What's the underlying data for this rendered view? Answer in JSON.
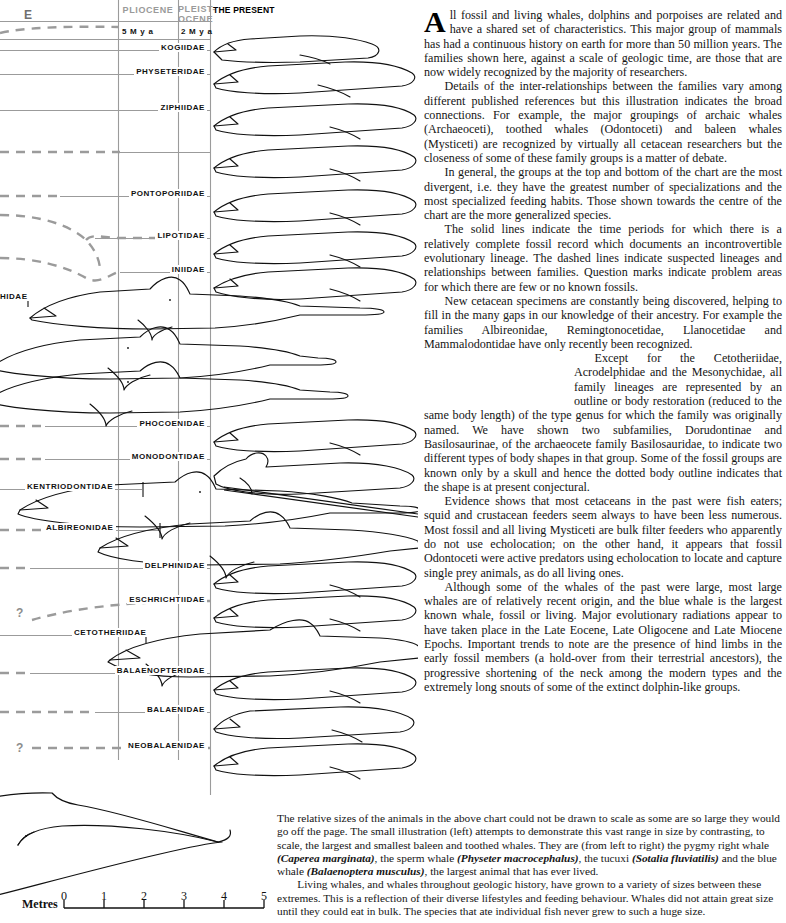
{
  "chart": {
    "left_epoch_partial": "E",
    "epochs": [
      {
        "label": "PLIOCENE",
        "x": 118,
        "w": 60
      },
      {
        "label": "PLEIST-\nOCENE",
        "x": 178,
        "w": 32
      },
      {
        "label": "THE PRESENT",
        "x": 211,
        "w": 70
      }
    ],
    "mya_marks": [
      {
        "label": "5 M y a",
        "x": 122,
        "y": 29
      },
      {
        "label": "2 M y a",
        "x": 181,
        "y": 29
      }
    ],
    "vertical_gridlines": [
      118,
      178,
      210
    ],
    "families": [
      {
        "name": "KOGIIDAE",
        "y": 50,
        "line": "solid",
        "line_from": 0,
        "line_to": 210,
        "label_right": 207
      },
      {
        "name": "PHYSETERIDAE",
        "y": 74,
        "line": "solid",
        "line_from": 0,
        "line_to": 210,
        "label_right": 207
      },
      {
        "name": "ZIPHIIDAE",
        "y": 110,
        "line": "solid",
        "line_from": 0,
        "line_to": 210,
        "label_right": 207
      },
      {
        "name": "",
        "y": 152,
        "line": "dashed",
        "line_from": 0,
        "line_to": 210,
        "label_right": 207
      },
      {
        "name": "PONTOPORIIDAE",
        "y": 196,
        "line": "mixed",
        "line_from": 0,
        "line_to": 210,
        "label_right": 207
      },
      {
        "name": "LIPOTIDAE",
        "y": 238,
        "line": "mixed",
        "line_from": 0,
        "line_to": 210,
        "label_right": 207
      },
      {
        "name": "INIIDAE",
        "y": 272,
        "line": "mixed",
        "line_from": 0,
        "line_to": 210,
        "label_right": 207
      },
      {
        "name": "PHIDAE",
        "y": 299,
        "line": "bracket",
        "line_from": 0,
        "line_to": 32,
        "label_right": 30
      },
      {
        "name": "PHOCOENIDAE",
        "y": 426,
        "line": "mixed",
        "line_from": 0,
        "line_to": 210,
        "label_right": 207
      },
      {
        "name": "MONODONTIDAE",
        "y": 459,
        "line": "mixed",
        "line_from": 0,
        "line_to": 210,
        "label_right": 207
      },
      {
        "name": "KENTRIODONTIDAE",
        "y": 489,
        "line": "bracket",
        "line_from": 0,
        "line_to": 120,
        "label_right": 146
      },
      {
        "name": "ALBIREONIDAE",
        "y": 530,
        "line": "bracket-dash",
        "line_from": 0,
        "line_to": 135,
        "label_right": 160
      },
      {
        "name": "DELPHINIDAE",
        "y": 568,
        "line": "mixed",
        "line_from": 0,
        "line_to": 210,
        "label_right": 207
      },
      {
        "name": "ESCHRICHTIIDAE",
        "y": 602,
        "line": "dashed",
        "line_from": 0,
        "line_to": 210,
        "label_right": 207
      },
      {
        "name": "CETOTHERIIDAE",
        "y": 635,
        "line": "bracket",
        "line_from": 0,
        "line_to": 148,
        "label_right": 146
      },
      {
        "name": "BALAENOPTERIDAE",
        "y": 673,
        "line": "mixed",
        "line_from": 0,
        "line_to": 210,
        "label_right": 207
      },
      {
        "name": "BALAENIDAE",
        "y": 712,
        "line": "mixed",
        "line_from": 0,
        "line_to": 210,
        "label_right": 207
      },
      {
        "name": "NEOBALAENIDAE",
        "y": 748,
        "line": "dashed",
        "line_from": 0,
        "line_to": 210,
        "label_right": 207
      }
    ],
    "question_marks": [
      {
        "label": "?",
        "x": 18,
        "y": 612
      },
      {
        "label": "?",
        "x": 18,
        "y": 748
      }
    ]
  },
  "article": {
    "dropcap": "A",
    "paragraphs": [
      "ll fossil and living whales, dolphins and porpoises are related and have a shared set of characteristics. This major group of mammals has had a continuous history on earth for more than 50 million years. The families shown here, against a scale of geologic time, are those that are now widely recognized by the majority of researchers.",
      "Details of the inter-relationships between the families vary among different published references but this illustration indicates the broad connections. For example, the major groupings of archaic whales (Archaeoceti), toothed whales (Odontoceti) and baleen whales (Mysticeti) are recognized by virtually all cetacean researchers but the closeness of some of these family groups is a matter of debate.",
      "In general, the groups at the top and bottom of the chart are the most divergent, i.e. they have the greatest number of specializations and the most specialized feeding habits. Those shown towards the centre of the chart are the more generalized species.",
      "The solid lines indicate the time periods for which there is a relatively complete fossil record which documents an incontrovertible evolutionary lineage. The dashed lines indicate suspected lineages and relationships between families. Question marks indicate problem areas for which there are few or no known fossils.",
      "New cetacean specimens are constantly being discovered, helping to fill in the many gaps in our knowledge of their ancestry. For example the families Albireonidae, Remingtonocetidae, Llanocetidae and Mammalodontidae have only recently been recognized.",
      "Except for the Cetotheriidae, Acrodelphidae and the Mesonychidae, all family lineages are represented by an outline or body restoration (reduced to the same body length) of the type genus for which the family was originally named. We have shown two subfamilies, Dorudontinae and Basilosaurinae, of the archaeocete family Basilosauridae, to indicate two different types of body shapes in that group. Some of the fossil groups are known only by a skull and hence the dotted body outline indicates that the shape is at present conjectural.",
      "Evidence shows that most cetaceans in the past were fish eaters; squid and crustacean feeders seem always to have been less numerous. Most fossil and all living Mysticeti are bulk filter feeders who apparently do not use echolocation; on the other hand, it appears that fossil Odontoceti were active predators using echolocation to locate and capture single prey animals, as do all living ones.",
      "Although some of the whales of the past were large, most large whales are of relatively recent origin, and the blue whale is the largest known whale, fossil or living. Major evolutionary radiations appear to have taken place in the Late Eocene, Late Oligocene and Late Miocene Epochs. Important trends to note are the presence of hind limbs in the early fossil members (a hold-over from their terrestrial ancestors), the progressive shortening of the neck among the modern types and the extremely long snouts of some of the extinct dolphin-like groups."
    ]
  },
  "caption": {
    "p1_a": "The relative sizes of the animals in the above chart could not be drawn to scale as some are so large they would go off the page. The small illustration (left) attempts to demonstrate this vast range in size by contrasting, to scale, the largest and smallest baleen and toothed whales. They are (from left to right) the pygmy right whale ",
    "p1_i1": "(Caperea marginata)",
    "p1_b": ", the sperm whale ",
    "p1_i2": "(Physeter macrocephalus)",
    "p1_c": ", the tucuxi ",
    "p1_i3": "(Sotalia fluviatilis)",
    "p1_d": " and the blue whale ",
    "p1_i4": "(Balaenoptera musculus)",
    "p1_e": ", the largest animal that has ever lived.",
    "p2": "Living whales, and whales throughout geologic history, have grown to a variety of sizes between these extremes. This is a reflection of their diverse lifestyles and feeding behaviour. Whales did not attain great size until they could eat in bulk. The species that ate individual fish never grew to such a huge size."
  },
  "scale": {
    "label": "Metres",
    "ticks": [
      "0",
      "1",
      "2",
      "3",
      "4",
      "5"
    ],
    "tick_x": [
      64,
      104,
      144,
      184,
      224,
      264
    ],
    "axis_y": 908
  },
  "colors": {
    "grid": "#9b9b9b",
    "ink": "#111111",
    "header_gray": "#9a9a9a"
  }
}
